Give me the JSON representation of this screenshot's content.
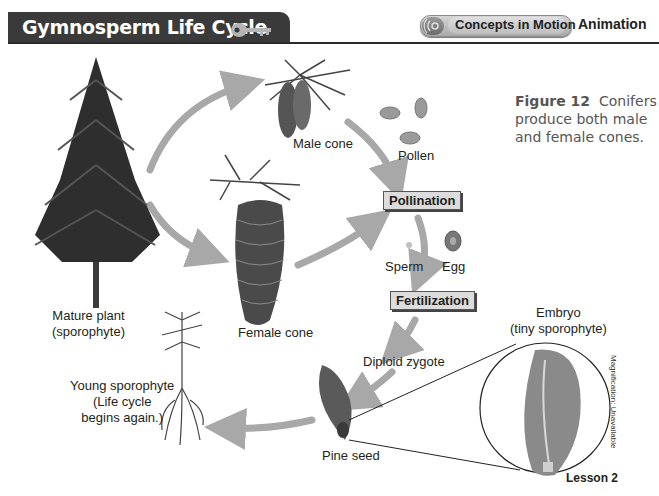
{
  "header": {
    "title": "Gymnosperm Life Cycle",
    "key_icon": "key-icon",
    "concepts_button": "Concepts in Motion",
    "concepts_icon": "motion-rings-icon",
    "animation_label": "Animation"
  },
  "caption": {
    "figure_label": "Figure 12",
    "text": "Conifers produce both male and female cones."
  },
  "diagram": {
    "stages": {
      "mature_plant_line1": "Mature plant",
      "mature_plant_line2": "(sporophyte)",
      "male_cone": "Male cone",
      "female_cone": "Female cone",
      "pollen": "Pollen",
      "pollination": "Pollination",
      "sperm": "Sperm",
      "egg": "Egg",
      "fertilization": "Fertilization",
      "diploid_zygote": "Diploid zygote",
      "pine_seed": "Pine seed",
      "embryo_line1": "Embryo",
      "embryo_line2": "(tiny sporophyte)",
      "young_line1": "Young sporophyte",
      "young_line2": "(Life cycle",
      "young_line3": "begins again.)"
    },
    "magnification_note": "Magnification: Unavailable",
    "arrow_color": "#a8a8a8"
  },
  "footer": {
    "lesson": "Lesson 2"
  }
}
